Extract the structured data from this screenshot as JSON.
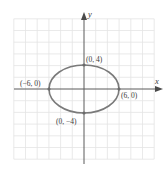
{
  "diagram": {
    "type": "ellipse-graph",
    "equation_params": {
      "a": 6,
      "b": 4,
      "center": [
        0,
        0
      ]
    },
    "axes": {
      "x_label": "x",
      "y_label": "y"
    },
    "grid": {
      "step_units": 2,
      "x_range": [
        -12,
        12
      ],
      "y_range": [
        -12,
        12
      ]
    },
    "points": [
      {
        "id": "top",
        "label": "(0, 4)",
        "x": 0,
        "y": 4
      },
      {
        "id": "bottom",
        "label": "(0, −4)",
        "x": 0,
        "y": -4
      },
      {
        "id": "left",
        "label": "(−6, 0)",
        "x": -6,
        "y": 0
      },
      {
        "id": "right",
        "label": "(6, 0)",
        "x": 6,
        "y": 0
      }
    ],
    "colors": {
      "grid": "#e4e4e4",
      "axis": "#5a5a5a",
      "ellipse": "#7a7a7a",
      "label": "#3a3a3a"
    }
  }
}
